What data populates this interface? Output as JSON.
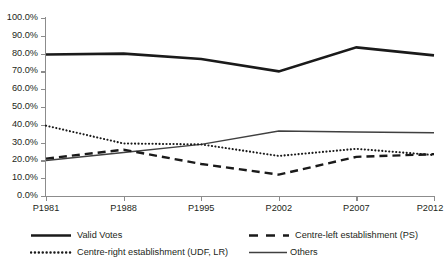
{
  "chart_data": {
    "type": "line",
    "title": "",
    "subtitle": "",
    "xlabel": "",
    "ylabel": "",
    "categories": [
      "P1981",
      "P1988",
      "P1995",
      "P2002",
      "P2007",
      "P2012"
    ],
    "ylim": [
      0,
      100
    ],
    "ytick_labels": [
      "100.0%",
      "90.0%",
      "80.0%",
      "70.0%",
      "60.0%",
      "50.0%",
      "40.0%",
      "30.0%",
      "20.0%",
      "10.0%",
      "0.0%"
    ],
    "ytick_values": [
      100,
      90,
      80,
      70,
      60,
      50,
      40,
      30,
      20,
      10,
      0
    ],
    "grid": false,
    "legend_position": "bottom",
    "series": [
      {
        "name": "Valid Votes",
        "style": "solid-thick",
        "color": "#1a1a1a",
        "values": [
          79.5,
          80.0,
          77.0,
          70.0,
          83.5,
          79.0
        ]
      },
      {
        "name": "Centre-left establishment (PS)",
        "style": "dashed",
        "color": "#1a1a1a",
        "values": [
          21.0,
          26.0,
          18.0,
          12.0,
          22.0,
          23.5
        ]
      },
      {
        "name": "Centre-right establishment (UDF, LR)",
        "style": "dotted",
        "color": "#1a1a1a",
        "values": [
          39.5,
          29.5,
          29.0,
          22.5,
          26.5,
          23.0
        ]
      },
      {
        "name": "Others",
        "style": "solid-thin",
        "color": "#404040",
        "values": [
          20.0,
          24.5,
          29.0,
          36.5,
          36.0,
          35.5
        ]
      }
    ]
  },
  "axis": {
    "ticks_y": [
      "100.0%",
      "90.0%",
      "80.0%",
      "70.0%",
      "60.0%",
      "50.0%",
      "40.0%",
      "30.0%",
      "20.0%",
      "10.0%",
      "0.0%"
    ],
    "ticks_x": [
      "P1981",
      "P1988",
      "P1995",
      "P2002",
      "P2007",
      "P2012"
    ],
    "axis_color": "#8c8c8c"
  },
  "legend": {
    "items": [
      {
        "label": "Valid Votes",
        "style": "solid-thick"
      },
      {
        "label": "Centre-left establishment (PS)",
        "style": "dashed"
      },
      {
        "label": "Centre-right establishment (UDF, LR)",
        "style": "dotted"
      },
      {
        "label": "Others",
        "style": "solid-thin"
      }
    ]
  }
}
